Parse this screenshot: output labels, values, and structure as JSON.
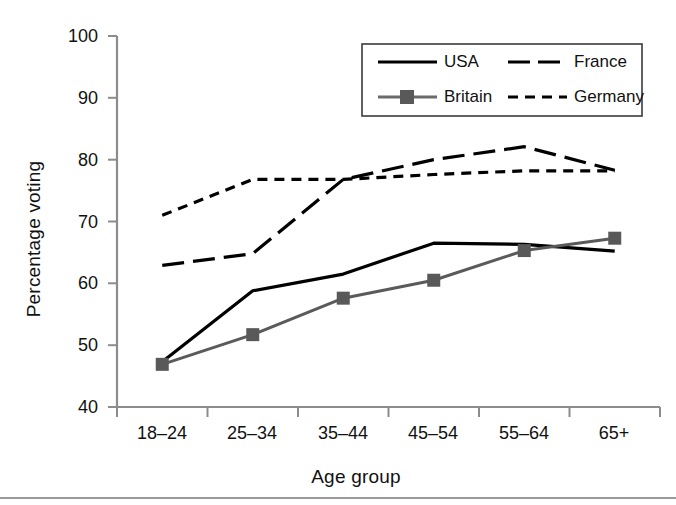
{
  "chart_data": {
    "type": "line",
    "title": "",
    "xlabel": "Age group",
    "ylabel": "Percentage voting",
    "categories": [
      "18–24",
      "25–34",
      "35–44",
      "45–54",
      "55–64",
      "65+"
    ],
    "ylim": [
      40,
      100
    ],
    "yticks": [
      40,
      50,
      60,
      70,
      80,
      90,
      100
    ],
    "grid": false,
    "legend_position": "top-right",
    "series": [
      {
        "name": "USA",
        "values": [
          47.3,
          58.8,
          61.5,
          66.5,
          66.3,
          65.2
        ],
        "style": "solid",
        "color": "#000000",
        "marker": "none"
      },
      {
        "name": "Britain",
        "values": [
          46.9,
          51.7,
          57.6,
          60.5,
          65.3,
          67.3
        ],
        "style": "solid",
        "color": "#5a5a5a",
        "marker": "square"
      },
      {
        "name": "France",
        "values": [
          62.9,
          64.8,
          76.8,
          80.0,
          82.1,
          78.3
        ],
        "style": "long-dash",
        "color": "#000000",
        "marker": "none"
      },
      {
        "name": "Germany",
        "values": [
          71.0,
          76.8,
          76.8,
          77.6,
          78.2,
          78.2
        ],
        "style": "short-dash",
        "color": "#000000",
        "marker": "none"
      }
    ]
  },
  "axes": {
    "ytick_labels": [
      "100",
      "90",
      "80",
      "70",
      "60",
      "50",
      "40"
    ],
    "xtick_labels": [
      "18–24",
      "25–34",
      "35–44",
      "45–54",
      "55–64",
      "65+"
    ],
    "y_axis_title": "Percentage voting",
    "x_axis_title": "Age group"
  },
  "legend": {
    "entries": [
      {
        "label": "USA",
        "style": "solid",
        "marker": "none",
        "color": "#000000"
      },
      {
        "label": "France",
        "style": "long-dash",
        "marker": "none",
        "color": "#000000"
      },
      {
        "label": "Britain",
        "style": "solid",
        "marker": "square",
        "color": "#5a5a5a"
      },
      {
        "label": "Germany",
        "style": "short-dash",
        "marker": "none",
        "color": "#000000"
      }
    ]
  },
  "colors": {
    "axis": "#8c8c8c",
    "usa": "#000000",
    "britain_line": "#6b6b6b",
    "britain_marker": "#595959",
    "france": "#000000",
    "germany": "#000000",
    "background": "#ffffff"
  }
}
